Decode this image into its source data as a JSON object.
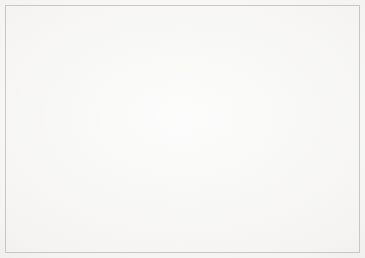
{
  "chart_data": {
    "type": "pie",
    "title": "Composition of total income",
    "xlabel": "",
    "ylabel": "",
    "categories": [
      "Interest income",
      "Commission income",
      "Other income"
    ],
    "values": [
      61,
      21,
      18
    ],
    "value_labels": [
      "61%",
      "21%",
      "18%"
    ],
    "unit": "%",
    "colors": [
      "#a8a8a8",
      "#8a8a8a",
      "#b5b5b5"
    ],
    "legend": {
      "position": "right",
      "entries": [
        {
          "label": "Interest income",
          "value_label": "61%",
          "value": 61,
          "color": "#a8a8a8"
        },
        {
          "label": "Commission income",
          "value_label": "21%",
          "value": 21,
          "color": "#8a8a8a"
        },
        {
          "label": "Other income",
          "value_label": "18%",
          "value": 18,
          "color": "#b5b5b5"
        }
      ]
    },
    "grid": false,
    "start_angle_deg": 0,
    "direction": "clockwise",
    "total": 100
  },
  "style": {
    "background": "#f3f2f0",
    "border_color": "#c9c7c4",
    "title_color": "#2a2a2a",
    "label_text_color": "#f4f4f4",
    "label_badge_color": "#3a3a3a",
    "legend_text_color": "#4a4a4a"
  }
}
